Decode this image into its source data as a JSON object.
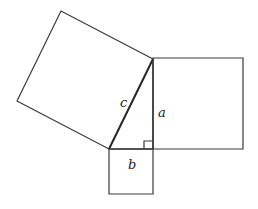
{
  "diagram": {
    "labels": {
      "hypotenuse": "c",
      "vertical_leg": "a",
      "horizontal_leg": "b"
    },
    "colors": {
      "stroke": "#3a3a3a",
      "background": "#ffffff"
    },
    "triangle": {
      "top": [
        153,
        59
      ],
      "right_angle": [
        153,
        149
      ],
      "bottom_left": [
        109,
        149
      ]
    },
    "squares": {
      "on_c": [
        [
          153,
          59
        ],
        [
          109,
          149
        ],
        [
          17,
          101
        ],
        [
          61,
          11
        ]
      ],
      "on_a": [
        [
          153,
          58
        ],
        [
          243,
          58
        ],
        [
          243,
          149
        ],
        [
          153,
          149
        ]
      ],
      "on_b": [
        [
          109,
          149
        ],
        [
          153,
          149
        ],
        [
          153,
          194
        ],
        [
          109,
          194
        ]
      ]
    }
  }
}
